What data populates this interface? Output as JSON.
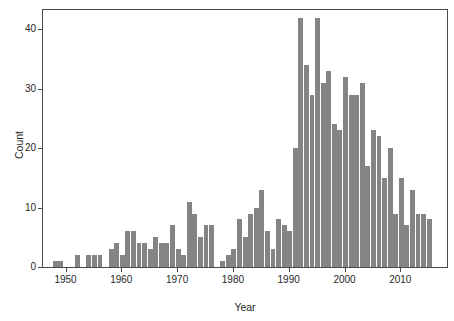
{
  "chart_data": {
    "type": "bar",
    "subtype": "histogram",
    "title": "",
    "xlabel": "Year",
    "ylabel": "Count",
    "x_range_shown": [
      1945,
      2017
    ],
    "ylim": [
      0,
      43.5
    ],
    "grid": false,
    "legend": false,
    "bar_color": "#848484",
    "background_color": "#ffffff",
    "xticks": [
      1950,
      1960,
      1970,
      1980,
      1990,
      2000,
      2010
    ],
    "yticks": [
      0,
      10,
      20,
      30,
      40
    ],
    "years": [
      1948,
      1949,
      1950,
      1951,
      1952,
      1953,
      1954,
      1955,
      1956,
      1957,
      1958,
      1959,
      1960,
      1961,
      1962,
      1963,
      1964,
      1965,
      1966,
      1967,
      1968,
      1969,
      1970,
      1971,
      1972,
      1973,
      1974,
      1975,
      1976,
      1977,
      1978,
      1979,
      1980,
      1981,
      1982,
      1983,
      1984,
      1985,
      1986,
      1987,
      1988,
      1989,
      1990,
      1991,
      1992,
      1993,
      1994,
      1995,
      1996,
      1997,
      1998,
      1999,
      2000,
      2001,
      2002,
      2003,
      2004,
      2005,
      2006,
      2007,
      2008,
      2009,
      2010,
      2011,
      2012,
      2013,
      2014,
      2015
    ],
    "values": [
      1,
      1,
      0,
      0,
      2,
      0,
      2,
      2,
      2,
      0,
      3,
      4,
      2,
      6,
      6,
      4,
      4,
      3,
      5,
      4,
      4,
      7,
      3,
      2,
      11,
      9,
      5,
      7,
      7,
      0,
      1,
      2,
      3,
      8,
      5,
      9,
      10,
      13,
      6,
      3,
      8,
      7,
      6,
      20,
      42,
      34,
      29,
      42,
      31,
      33,
      24,
      23,
      32,
      29,
      29,
      31,
      17,
      23,
      22,
      15,
      20,
      9,
      15,
      7,
      13,
      9,
      9,
      8
    ]
  }
}
